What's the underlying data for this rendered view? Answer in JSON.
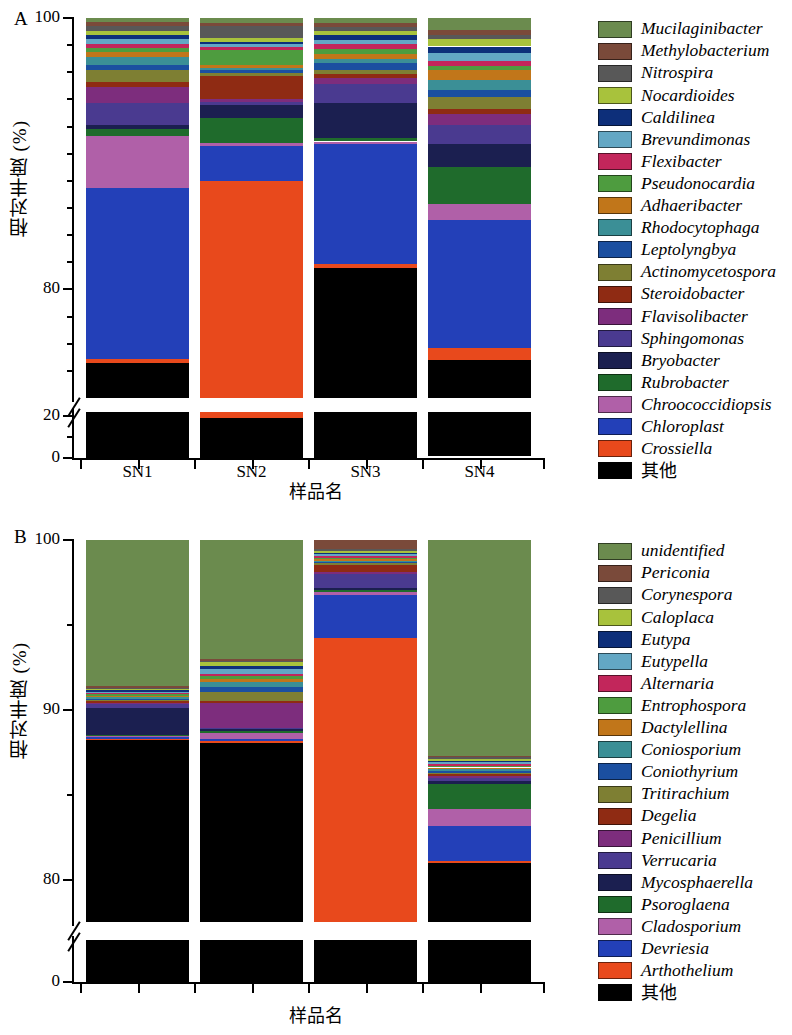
{
  "figure": {
    "panels": [
      {
        "letter": "A",
        "ylabel": "相对丰度 (%)",
        "xlabel": "样品名"
      },
      {
        "letter": "B",
        "ylabel": "相对丰度 (%)",
        "xlabel": "样品名"
      }
    ]
  },
  "chart_data": [
    {
      "type": "bar",
      "id": "panel-a",
      "title": "A",
      "stacked": true,
      "xlabel": "样品名",
      "ylabel": "相对丰度 (%)",
      "categories": [
        "SN1",
        "SN2",
        "SN3",
        "SN4"
      ],
      "broken_axis": true,
      "axis_lower": {
        "ylim": [
          0,
          22
        ],
        "ticks_major": [
          0,
          20
        ],
        "ticks_minor": [
          10
        ]
      },
      "axis_upper": {
        "ylim": [
          72,
          100
        ],
        "ticks_major": [
          80,
          100
        ],
        "ticks_minor": [
          74,
          76,
          78,
          82,
          84,
          86,
          88,
          90,
          92,
          94,
          96,
          98
        ]
      },
      "ytick_labels": [
        "0",
        "20",
        "80",
        "100"
      ],
      "legend_position": "right",
      "series": [
        {
          "name": "Mucilaginibacter",
          "color": "#6b8b4e",
          "values": [
            0.3,
            0.35,
            0.35,
            0.9
          ]
        },
        {
          "name": "Methylobacterium",
          "color": "#7a4a3a",
          "values": [
            0.3,
            0.25,
            0.3,
            0.35
          ]
        },
        {
          "name": "Nitrospira",
          "color": "#585858",
          "values": [
            0.35,
            0.9,
            0.3,
            0.3
          ]
        },
        {
          "name": "Nocardioides",
          "color": "#a8c23c",
          "values": [
            0.3,
            0.25,
            0.3,
            0.55
          ]
        },
        {
          "name": "Caldilinea",
          "color": "#0d2f7a",
          "values": [
            0.3,
            0.2,
            0.35,
            0.45
          ]
        },
        {
          "name": "Brevundimonas",
          "color": "#63a7c4",
          "values": [
            0.35,
            0.2,
            0.3,
            0.6
          ]
        },
        {
          "name": "Flexibacter",
          "color": "#c2265b",
          "values": [
            0.3,
            0.2,
            0.4,
            0.35
          ]
        },
        {
          "name": "Pseudonocardia",
          "color": "#4e9c3f",
          "values": [
            0.3,
            1.1,
            0.35,
            0.3
          ]
        },
        {
          "name": "Adhaeribacter",
          "color": "#c1761a",
          "values": [
            0.35,
            0.2,
            0.35,
            0.8
          ]
        },
        {
          "name": "Rhodocytophaga",
          "color": "#3b8f96",
          "values": [
            0.6,
            0.2,
            0.35,
            0.7
          ]
        },
        {
          "name": "Leptolyngbya",
          "color": "#1b4fa0",
          "values": [
            0.35,
            0.2,
            0.45,
            0.55
          ]
        },
        {
          "name": "Actinomycetospora",
          "color": "#7e7f33",
          "values": [
            0.9,
            0.2,
            0.3,
            0.85
          ]
        },
        {
          "name": "Steroidobacter",
          "color": "#8f2b13",
          "values": [
            0.35,
            1.7,
            0.35,
            0.35
          ]
        },
        {
          "name": "Flavisolibacter",
          "color": "#7d2d7d",
          "values": [
            1.2,
            0.25,
            0.4,
            0.85
          ]
        },
        {
          "name": "Sphingomonas",
          "color": "#4a3a90",
          "values": [
            1.6,
            0.2,
            1.4,
            1.4
          ]
        },
        {
          "name": "Bryobacter",
          "color": "#1b1f50",
          "values": [
            0.3,
            1.0,
            2.6,
            1.7
          ]
        },
        {
          "name": "Rubrobacter",
          "color": "#1f6b2c",
          "values": [
            0.55,
            1.8,
            0.25,
            2.7
          ]
        },
        {
          "name": "Chroococcidiopsis",
          "color": "#b060a8",
          "values": [
            3.8,
            0.2,
            0.2,
            1.2
          ]
        },
        {
          "name": "Chloroplast",
          "color": "#2340b8",
          "values": [
            12.6,
            2.6,
            8.8,
            9.4
          ]
        },
        {
          "name": "Crossiella",
          "color": "#e8491c",
          "values": [
            0.3,
            68.8,
            0.3,
            0.9
          ]
        },
        {
          "name": "其他",
          "color": "#000000",
          "values": [
            74.6,
            19.4,
            81.4,
            73.95
          ]
        }
      ]
    },
    {
      "type": "bar",
      "id": "panel-b",
      "title": "B",
      "stacked": true,
      "xlabel": "样品名",
      "ylabel": "相对丰度 (%)",
      "categories": [
        "SN1",
        "SN2",
        "SN3",
        "SN4"
      ],
      "broken_axis": true,
      "axis_lower": {
        "ylim": [
          0,
          2
        ],
        "ticks_major": [
          0
        ],
        "ticks_minor": []
      },
      "axis_upper": {
        "ylim": [
          77.5,
          100
        ],
        "ticks_major": [
          80,
          90,
          100
        ],
        "ticks_minor": [
          85,
          95
        ]
      },
      "ytick_labels": [
        "0",
        "80",
        "90",
        "100"
      ],
      "legend_position": "right",
      "series": [
        {
          "name": "unidentified",
          "color": "#6b8b4e",
          "values": [
            8.6,
            7.0,
            0.0,
            12.7
          ]
        },
        {
          "name": "Periconia",
          "color": "#7a4a3a",
          "values": [
            0.1,
            0.1,
            0.55,
            0.1
          ]
        },
        {
          "name": "Corynespora",
          "color": "#585858",
          "values": [
            0.08,
            0.1,
            0.1,
            0.1
          ]
        },
        {
          "name": "Caloplaca",
          "color": "#a8c23c",
          "values": [
            0.08,
            0.2,
            0.1,
            0.1
          ]
        },
        {
          "name": "Eutypa",
          "color": "#0d2f7a",
          "values": [
            0.08,
            0.22,
            0.1,
            0.1
          ]
        },
        {
          "name": "Eutypella",
          "color": "#63a7c4",
          "values": [
            0.08,
            0.25,
            0.1,
            0.1
          ]
        },
        {
          "name": "Alternaria",
          "color": "#c2265b",
          "values": [
            0.08,
            0.12,
            0.1,
            0.1
          ]
        },
        {
          "name": "Entrophospora",
          "color": "#4e9c3f",
          "values": [
            0.08,
            0.22,
            0.08,
            0.1
          ]
        },
        {
          "name": "Dactylellina",
          "color": "#c1761a",
          "values": [
            0.08,
            0.15,
            0.08,
            0.1
          ]
        },
        {
          "name": "Coniosporium",
          "color": "#3b8f96",
          "values": [
            0.08,
            0.3,
            0.08,
            0.1
          ]
        },
        {
          "name": "Coniothyrium",
          "color": "#1b4fa0",
          "values": [
            0.08,
            0.3,
            0.08,
            0.1
          ]
        },
        {
          "name": "Tritirachium",
          "color": "#7e7f33",
          "values": [
            0.08,
            0.55,
            0.08,
            0.1
          ]
        },
        {
          "name": "Degelia",
          "color": "#8f2b13",
          "values": [
            0.08,
            0.1,
            0.45,
            0.1
          ]
        },
        {
          "name": "Penicillium",
          "color": "#7d2d7d",
          "values": [
            0.08,
            1.45,
            0.1,
            0.1
          ]
        },
        {
          "name": "Verrucaria",
          "color": "#4a3a90",
          "values": [
            0.25,
            0.1,
            0.85,
            0.2
          ]
        },
        {
          "name": "Mycosphaerella",
          "color": "#1b1f50",
          "values": [
            1.55,
            0.1,
            0.1,
            0.18
          ]
        },
        {
          "name": "Psoroglaena",
          "color": "#1f6b2c",
          "values": [
            0.08,
            0.1,
            0.1,
            1.45
          ]
        },
        {
          "name": "Cladosporium",
          "color": "#b060a8",
          "values": [
            0.08,
            0.38,
            0.18,
            1.0
          ]
        },
        {
          "name": "Devriesia",
          "color": "#2340b8",
          "values": [
            0.08,
            0.1,
            2.55,
            2.1
          ]
        },
        {
          "name": "Arthothelium",
          "color": "#e8491c",
          "values": [
            0.08,
            0.1,
            16.7,
            0.1
          ]
        },
        {
          "name": "其他",
          "color": "#000000",
          "values": [
            89.1,
            88.16,
            77.52,
            81.07
          ]
        }
      ]
    }
  ],
  "legend_a": {
    "items": [
      {
        "label": "Mucilaginibacter",
        "color": "#6b8b4e"
      },
      {
        "label": "Methylobacterium",
        "color": "#7a4a3a"
      },
      {
        "label": "Nitrospira",
        "color": "#585858"
      },
      {
        "label": "Nocardioides",
        "color": "#a8c23c"
      },
      {
        "label": "Caldilinea",
        "color": "#0d2f7a"
      },
      {
        "label": "Brevundimonas",
        "color": "#63a7c4"
      },
      {
        "label": "Flexibacter",
        "color": "#c2265b"
      },
      {
        "label": "Pseudonocardia",
        "color": "#4e9c3f"
      },
      {
        "label": "Adhaeribacter",
        "color": "#c1761a"
      },
      {
        "label": "Rhodocytophaga",
        "color": "#3b8f96"
      },
      {
        "label": "Leptolyngbya",
        "color": "#1b4fa0"
      },
      {
        "label": "Actinomycetospora",
        "color": "#7e7f33"
      },
      {
        "label": "Steroidobacter",
        "color": "#8f2b13"
      },
      {
        "label": "Flavisolibacter",
        "color": "#7d2d7d"
      },
      {
        "label": "Sphingomonas",
        "color": "#4a3a90"
      },
      {
        "label": "Bryobacter",
        "color": "#1b1f50"
      },
      {
        "label": "Rubrobacter",
        "color": "#1f6b2c"
      },
      {
        "label": "Chroococcidiopsis",
        "color": "#b060a8"
      },
      {
        "label": "Chloroplast",
        "color": "#2340b8"
      },
      {
        "label": "Crossiella",
        "color": "#e8491c"
      },
      {
        "label": "其他",
        "color": "#000000",
        "cjk": true
      }
    ]
  },
  "legend_b": {
    "items": [
      {
        "label": "unidentified",
        "color": "#6b8b4e"
      },
      {
        "label": "Periconia",
        "color": "#7a4a3a"
      },
      {
        "label": "Corynespora",
        "color": "#585858"
      },
      {
        "label": "Caloplaca",
        "color": "#a8c23c"
      },
      {
        "label": "Eutypa",
        "color": "#0d2f7a"
      },
      {
        "label": "Eutypella",
        "color": "#63a7c4"
      },
      {
        "label": "Alternaria",
        "color": "#c2265b"
      },
      {
        "label": "Entrophospora",
        "color": "#4e9c3f"
      },
      {
        "label": "Dactylellina",
        "color": "#c1761a"
      },
      {
        "label": "Coniosporium",
        "color": "#3b8f96"
      },
      {
        "label": "Coniothyrium",
        "color": "#1b4fa0"
      },
      {
        "label": "Tritirachium",
        "color": "#7e7f33"
      },
      {
        "label": "Degelia",
        "color": "#8f2b13"
      },
      {
        "label": "Penicillium",
        "color": "#7d2d7d"
      },
      {
        "label": "Verrucaria",
        "color": "#4a3a90"
      },
      {
        "label": "Mycosphaerella",
        "color": "#1b1f50"
      },
      {
        "label": "Psoroglaena",
        "color": "#1f6b2c"
      },
      {
        "label": "Cladosporium",
        "color": "#b060a8"
      },
      {
        "label": "Devriesia",
        "color": "#2340b8"
      },
      {
        "label": "Arthothelium",
        "color": "#e8491c"
      },
      {
        "label": "其他",
        "color": "#000000",
        "cjk": true
      }
    ]
  }
}
